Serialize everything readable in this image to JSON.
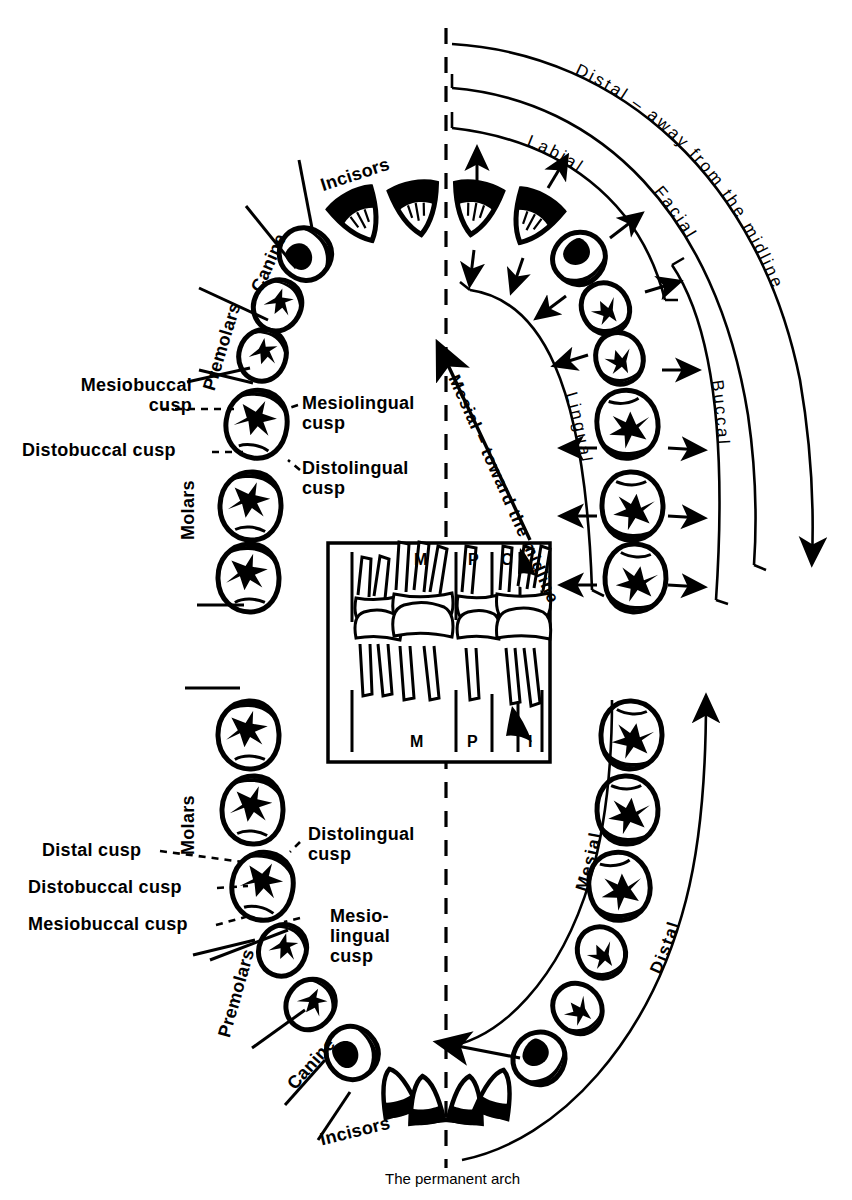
{
  "figure": {
    "caption": "The permanent arch",
    "ink_color": "#000000",
    "background_color": "#ffffff"
  },
  "upper_arch": {
    "group_labels": [
      {
        "text": "Incisors",
        "name": "upper-incisors-label"
      },
      {
        "text": "Canine",
        "name": "upper-canine-label"
      },
      {
        "text": "Premolars",
        "name": "upper-premolars-label"
      },
      {
        "text": "Molars",
        "name": "upper-molars-label"
      }
    ],
    "cusp_labels": [
      {
        "text": "Mesiobuccal\ncusp",
        "name": "upper-mesiobuccal-cusp-label"
      },
      {
        "text": "Distobuccal cusp",
        "name": "upper-distobuccal-cusp-label"
      },
      {
        "text": "Mesiolingual\ncusp",
        "name": "upper-mesiolingual-cusp-label"
      },
      {
        "text": "Distolingual\ncusp",
        "name": "upper-distolingual-cusp-label"
      }
    ]
  },
  "lower_arch": {
    "group_labels": [
      {
        "text": "Molars",
        "name": "lower-molars-label"
      },
      {
        "text": "Premolars",
        "name": "lower-premolars-label"
      },
      {
        "text": "Canine",
        "name": "lower-canine-label"
      },
      {
        "text": "Incisors",
        "name": "lower-incisors-label"
      }
    ],
    "cusp_labels": [
      {
        "text": "Distal cusp",
        "name": "lower-distal-cusp-label"
      },
      {
        "text": "Distobuccal cusp",
        "name": "lower-distobuccal-cusp-label"
      },
      {
        "text": "Mesiobuccal cusp",
        "name": "lower-mesiobuccal-cusp-label"
      },
      {
        "text": "Distolingual\ncusp",
        "name": "lower-distolingual-cusp-label"
      },
      {
        "text": "Mesio-\nlingual\ncusp",
        "name": "lower-mesiolingual-cusp-label"
      }
    ]
  },
  "directional_arcs": {
    "upper_right": [
      {
        "text": "Distal – away from the midline",
        "name": "arc-distal-away-midline"
      },
      {
        "text": "Facial",
        "name": "arc-facial"
      },
      {
        "text": "Labial",
        "name": "arc-labial"
      },
      {
        "text": "Buccal",
        "name": "arc-buccal"
      },
      {
        "text": "Lingual",
        "name": "arc-lingual"
      }
    ],
    "midline_arrow": {
      "text": "Mesial – toward the midline",
      "name": "arrow-mesial-toward-midline"
    },
    "lower_right": [
      {
        "text": "Mesial",
        "name": "arc-mesial-lower"
      },
      {
        "text": "Distal",
        "name": "arc-distal-lower"
      }
    ]
  },
  "inset": {
    "name": "lateral-view-inset",
    "top_labels": [
      "M",
      "P",
      "C"
    ],
    "bottom_labels": [
      "M",
      "P",
      "I"
    ]
  },
  "midline": {
    "name": "midline-dashed",
    "style": "dashed vertical"
  }
}
